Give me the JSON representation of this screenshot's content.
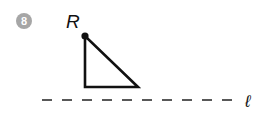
{
  "problem": {
    "number": "8",
    "badge_color": "#a6a6a6"
  },
  "figure": {
    "point_label": "R",
    "line_label": "ℓ",
    "stroke_color": "#111111",
    "triangle": {
      "vertices": [
        [
          85,
          36
        ],
        [
          85,
          87
        ],
        [
          138,
          87
        ]
      ],
      "right_angle_at": [
        85,
        87
      ],
      "marked_point": "R"
    },
    "line": {
      "style": "dashed",
      "y": 100,
      "x_start": 42,
      "x_end": 238,
      "dash": 10,
      "gap": 10
    }
  }
}
